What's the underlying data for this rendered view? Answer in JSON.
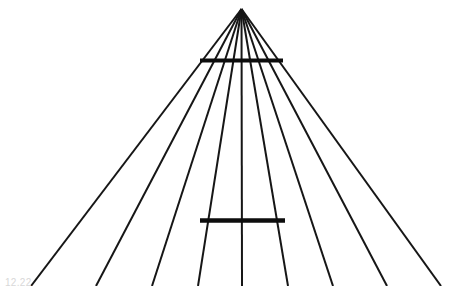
{
  "figure": {
    "name": "ponzo-illusion",
    "background_color": "#ffffff",
    "line_color": "#161616",
    "bar_color": "#0d0d0d",
    "width": 466,
    "height": 286,
    "apex": {
      "x": 241.5,
      "y": 9
    },
    "radiating_lines": [
      {
        "id": "line-1",
        "x_bottom": 31,
        "y_bottom": 286,
        "stroke_width": 2.0
      },
      {
        "id": "line-2",
        "x_bottom": 96,
        "y_bottom": 286,
        "stroke_width": 2.0
      },
      {
        "id": "line-3",
        "x_bottom": 152,
        "y_bottom": 286,
        "stroke_width": 2.0
      },
      {
        "id": "line-4",
        "x_bottom": 198,
        "y_bottom": 286,
        "stroke_width": 2.0
      },
      {
        "id": "line-5",
        "x_bottom": 242,
        "y_bottom": 286,
        "stroke_width": 2.0
      },
      {
        "id": "line-6",
        "x_bottom": 288,
        "y_bottom": 286,
        "stroke_width": 2.0
      },
      {
        "id": "line-7",
        "x_bottom": 333,
        "y_bottom": 286,
        "stroke_width": 2.0
      },
      {
        "id": "line-8",
        "x_bottom": 387,
        "y_bottom": 286,
        "stroke_width": 2.0
      },
      {
        "id": "line-9",
        "x_bottom": 441,
        "y_bottom": 286,
        "stroke_width": 2.0
      }
    ],
    "crossbars": [
      {
        "id": "upper-bar",
        "label": "upper horizontal bar",
        "x1": 200,
        "x2": 283,
        "y": 60.5,
        "stroke_width": 4.0,
        "length_px": 83
      },
      {
        "id": "lower-bar",
        "label": "lower horizontal bar",
        "x1": 200,
        "x2": 285,
        "y": 220.5,
        "stroke_width": 4.5,
        "length_px": 85
      }
    ],
    "caption_remnant": "12.22"
  }
}
